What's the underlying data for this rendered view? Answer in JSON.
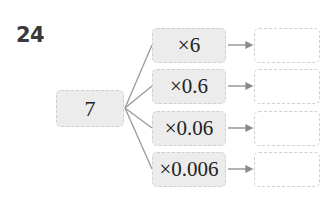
{
  "question_number": "24",
  "start_value": "7",
  "operations": [
    {
      "label": "×6",
      "answer": ""
    },
    {
      "label": "×0.6",
      "answer": ""
    },
    {
      "label": "×0.06",
      "answer": ""
    },
    {
      "label": "×0.006",
      "answer": ""
    }
  ],
  "colors": {
    "box_fill": "#ececec",
    "border": "#cfcfcf",
    "line": "#999999",
    "text": "#222222"
  }
}
